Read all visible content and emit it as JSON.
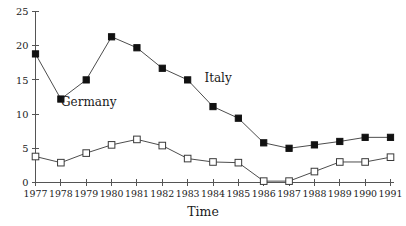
{
  "chart_data": {
    "type": "line",
    "title": "",
    "xlabel": "Time",
    "ylabel": "",
    "x": [
      1977,
      1978,
      1979,
      1980,
      1981,
      1982,
      1983,
      1984,
      1985,
      1986,
      1987,
      1988,
      1989,
      1990,
      1991
    ],
    "categories": [
      "1977",
      "1978",
      "1979",
      "1980",
      "1981",
      "1982",
      "1983",
      "1984",
      "1985",
      "1986",
      "1987",
      "1988",
      "1989",
      "1990",
      "1991"
    ],
    "xlim": [
      1977,
      1991
    ],
    "ylim": [
      0,
      25
    ],
    "yticks": [
      0,
      5,
      10,
      15,
      20,
      25
    ],
    "ytick_labels": [
      "0",
      "5",
      "10",
      "15",
      "20",
      "25"
    ],
    "grid": false,
    "legend": "inline-annotations",
    "series": [
      {
        "name": "Germany",
        "marker": "filled-square",
        "color": "#111111",
        "label_x": 1979.1,
        "label_y": 11.2,
        "values": [
          18.8,
          12.2,
          15.0,
          21.3,
          19.7,
          16.7,
          15.0,
          11.1,
          9.4,
          5.8,
          5.0,
          5.5,
          6.0,
          6.6,
          6.6
        ]
      },
      {
        "name": "Italy",
        "marker": "open-square",
        "color": "#ffffff",
        "label_x": 1984.2,
        "label_y": 14.7,
        "values": [
          3.8,
          2.9,
          4.3,
          5.5,
          6.3,
          5.4,
          3.5,
          3.0,
          2.9,
          0.2,
          0.2,
          1.6,
          3.0,
          3.0,
          3.7
        ]
      }
    ],
    "annotations": [
      {
        "text": "Germany",
        "x": 1979.1,
        "y": 11.2
      },
      {
        "text": "Italy",
        "x": 1984.2,
        "y": 14.7
      }
    ]
  },
  "axes": {
    "x_axis_title": "Time",
    "y_axis_title": ""
  }
}
